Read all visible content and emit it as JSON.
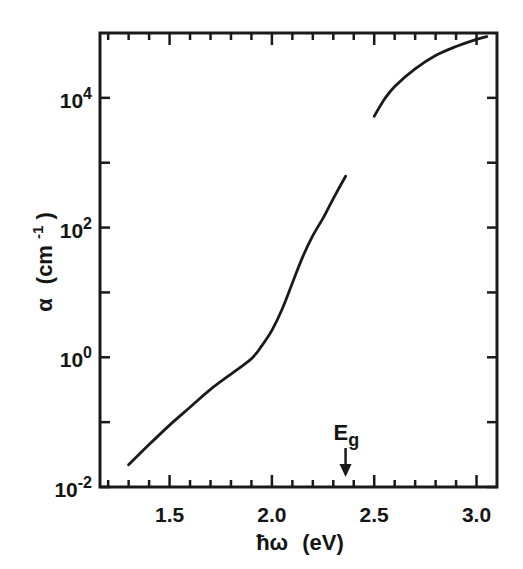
{
  "chart_data": {
    "type": "line",
    "title": "",
    "xlabel": "ħω (eV)",
    "ylabel": "α (cm⁻¹)",
    "xlim": [
      1.16,
      3.1
    ],
    "ylim": [
      0.01,
      100000
    ],
    "yscale": "log",
    "grid": false,
    "legend": null,
    "x_ticks": [
      {
        "value": 1.5,
        "label": "1.5"
      },
      {
        "value": 2.0,
        "label": "2.0"
      },
      {
        "value": 2.5,
        "label": "2.5"
      },
      {
        "value": 3.0,
        "label": "3.0"
      }
    ],
    "y_ticks": [
      {
        "value": 0.01,
        "base": "10",
        "exp": "-2"
      },
      {
        "value": 1,
        "base": "10",
        "exp": "0"
      },
      {
        "value": 100,
        "base": "10",
        "exp": "2"
      },
      {
        "value": 10000,
        "base": "10",
        "exp": "4"
      }
    ],
    "series": [
      {
        "name": "below-gap absorption",
        "x": [
          1.3,
          1.4,
          1.5,
          1.6,
          1.7,
          1.8,
          1.9,
          1.95,
          2.0,
          2.05,
          2.1,
          2.15,
          2.2,
          2.25,
          2.3,
          2.36
        ],
        "y": [
          0.022,
          0.045,
          0.09,
          0.17,
          0.32,
          0.55,
          0.95,
          1.5,
          2.6,
          5.5,
          14,
          35,
          75,
          140,
          280,
          620
        ]
      },
      {
        "name": "above-gap absorption",
        "x": [
          2.5,
          2.55,
          2.6,
          2.7,
          2.8,
          2.9,
          3.0,
          3.05
        ],
        "y": [
          5200,
          9500,
          15000,
          28000,
          45000,
          62000,
          80000,
          88000
        ]
      }
    ],
    "annotations": [
      {
        "text": "E",
        "subscript": "g",
        "x": 2.36,
        "type": "arrow-down"
      }
    ]
  },
  "labels": {
    "x_axis_prefix": "ħω",
    "x_axis_unit": "(eV)",
    "y_axis_symbol": "α",
    "y_axis_unit_open": "(cm",
    "y_axis_unit_exp": "-1",
    "y_axis_unit_close": ")",
    "eg_main": "E",
    "eg_sub": "g"
  }
}
